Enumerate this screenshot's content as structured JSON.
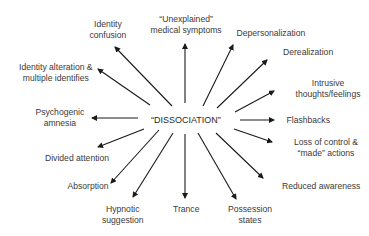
{
  "diagram": {
    "type": "radial concept map",
    "center": {
      "label": "“DISSOCIATION”",
      "x": 186,
      "y": 120
    },
    "line_color": "#1a1a1a",
    "nodes": [
      {
        "id": "identity-confusion",
        "lines": [
          "Identity",
          "confusion"
        ],
        "cx": 108,
        "top": 19,
        "arrow": [
          172,
          106,
          115,
          47
        ]
      },
      {
        "id": "unexplained-medical-symptoms",
        "lines": [
          "“Unexplained”",
          "medical symptoms"
        ],
        "cx": 186,
        "top": 14,
        "arrow": [
          185,
          103,
          185,
          44
        ]
      },
      {
        "id": "depersonalization",
        "lines": [
          "Depersonalization"
        ],
        "cx": 271,
        "top": 28,
        "arrow": [
          203,
          106,
          233,
          45
        ]
      },
      {
        "id": "derealization",
        "lines": [
          "Derealization"
        ],
        "cx": 308,
        "top": 47,
        "arrow": [
          217,
          108,
          267,
          60
        ]
      },
      {
        "id": "intrusive-thoughts",
        "lines": [
          "Intrusive",
          "thoughts/feelings"
        ],
        "cx": 328,
        "top": 78,
        "arrow": [
          235,
          112,
          274,
          91
        ]
      },
      {
        "id": "flashbacks",
        "lines": [
          "Flashbacks"
        ],
        "cx": 308,
        "top": 115,
        "arrow": [
          240,
          120,
          274,
          120
        ]
      },
      {
        "id": "loss-of-control",
        "lines": [
          "Loss of control &",
          "“made” actions"
        ],
        "cx": 326,
        "top": 137,
        "arrow": [
          234,
          129,
          272,
          142
        ]
      },
      {
        "id": "reduced-awareness",
        "lines": [
          "Reduced awareness"
        ],
        "cx": 321,
        "top": 181,
        "arrow": [
          216,
          133,
          263,
          178
        ]
      },
      {
        "id": "possession-states",
        "lines": [
          "Possession",
          "states"
        ],
        "cx": 250,
        "top": 204,
        "arrow": [
          198,
          133,
          236,
          199
        ]
      },
      {
        "id": "trance",
        "lines": [
          "Trance"
        ],
        "cx": 186,
        "top": 204,
        "arrow": [
          185,
          134,
          185,
          198
        ]
      },
      {
        "id": "hypnotic-suggestion",
        "lines": [
          "Hypnotic",
          "suggestion"
        ],
        "cx": 123,
        "top": 204,
        "arrow": [
          173,
          133,
          133,
          197
        ]
      },
      {
        "id": "absorption",
        "lines": [
          "Absorption"
        ],
        "cx": 88,
        "top": 181,
        "arrow": [
          159,
          130,
          111,
          183
        ]
      },
      {
        "id": "divided-attention",
        "lines": [
          "Divided attention"
        ],
        "cx": 77,
        "top": 153,
        "arrow": [
          144,
          129,
          98,
          147
        ]
      },
      {
        "id": "psychogenic-amnesia",
        "lines": [
          "Psychogenic",
          "amnesia"
        ],
        "cx": 60,
        "top": 107,
        "arrow": [
          138,
          118,
          92,
          118
        ]
      },
      {
        "id": "identity-alteration",
        "lines": [
          "Identity alteration &",
          "multiple identifies"
        ],
        "cx": 56,
        "top": 62,
        "arrow": [
          150,
          105,
          98,
          69
        ]
      }
    ]
  }
}
